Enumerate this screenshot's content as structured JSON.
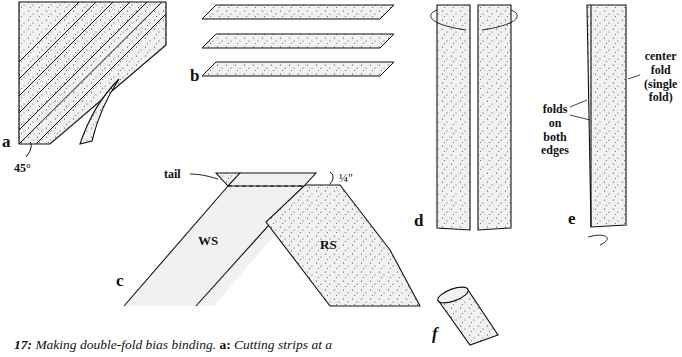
{
  "figure": {
    "panels": {
      "a": {
        "label": "a",
        "angle_note": "45°"
      },
      "b": {
        "label": "b"
      },
      "c": {
        "label": "c",
        "tail_note": "tail",
        "seam_note": "¼\"",
        "wrong_side": "WS",
        "right_side": "RS"
      },
      "d": {
        "label": "d"
      },
      "e": {
        "label": "e",
        "left_note": "folds\non\nboth\nedges",
        "right_note": "center\nfold\n(single\nfold)"
      },
      "f": {
        "label": "f"
      }
    },
    "caption": {
      "number": "17:",
      "title": "Making double-fold bias binding.",
      "part_label": "a:",
      "part_text": "Cutting strips at a"
    }
  },
  "colors": {
    "ink": "#111111",
    "fabric_fill": "#f1f1f1",
    "dot": "#333333"
  }
}
